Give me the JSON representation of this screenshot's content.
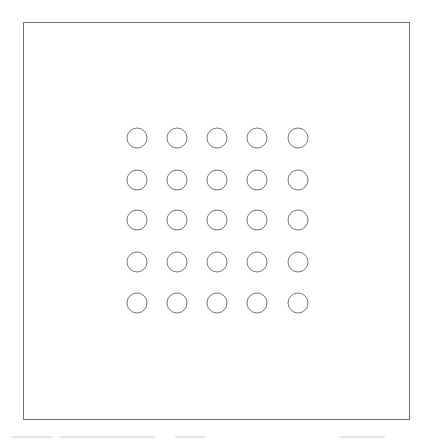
{
  "diagram": {
    "type": "dot-grid",
    "rows": 5,
    "columns": 5,
    "frame": {
      "x": 23,
      "y": 22,
      "width": 386,
      "height": 397,
      "stroke": "#6e6e6e"
    },
    "circle": {
      "radius": 10,
      "stroke": "#777777",
      "fill": "none",
      "stroke_width": 1
    },
    "column_centers_x": [
      137,
      177,
      217,
      257,
      298
    ],
    "row_centers_y": [
      138,
      180,
      220,
      262,
      303
    ]
  }
}
